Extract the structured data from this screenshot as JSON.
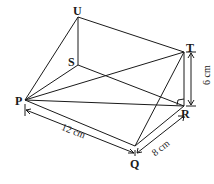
{
  "diagram": {
    "type": "triangular prism (wedge)",
    "vertices": {
      "U": "U",
      "T": "T",
      "S": "S",
      "P": "P",
      "R": "R",
      "Q": "Q"
    },
    "dimensions": {
      "PQ": "12 cm",
      "QR": "8 cm",
      "RT": "6 cm"
    },
    "right_angle_at": "R"
  }
}
